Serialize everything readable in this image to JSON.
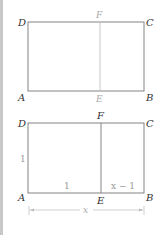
{
  "figure_top": {
    "vertices": {
      "D": "D",
      "C": "C",
      "A": "A",
      "B": "B",
      "F": "F",
      "E": "E"
    }
  },
  "figure_bottom": {
    "vertices": {
      "D": "D",
      "C": "C",
      "A": "A",
      "B": "B",
      "F": "F",
      "E": "E"
    },
    "side_AD": "1",
    "segment_AE": "1",
    "segment_EB": "x − 1",
    "total_AB": "x"
  },
  "colors": {
    "line_dark": "#666666",
    "line_light": "#aaaaaa",
    "sidebar": "#c8c8c8"
  }
}
